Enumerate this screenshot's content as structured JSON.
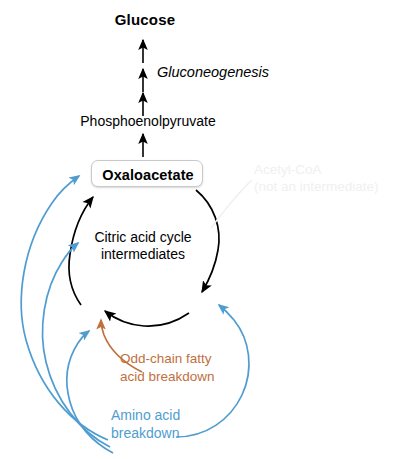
{
  "diagram": {
    "nodes": {
      "glucose": "Glucose",
      "pathway": "Gluconeogenesis",
      "pep": "Phosphoenolpyruvate",
      "oxaloacetate": "Oxaloacetate",
      "cycle_line1": "Citric acid cycle",
      "cycle_line2": "intermediates",
      "acetyl_line1": "Acetyl-CoA",
      "acetyl_line2": "(not an intermediate)",
      "odd_chain_line1": "Odd-chain fatty",
      "odd_chain_line2": "acid breakdown",
      "amino_line1": "Amino acid",
      "amino_line2": "breakdown"
    },
    "colors": {
      "black": "#000000",
      "blue": "#4f9dd0",
      "orange": "#c1703d",
      "faint_gray": "#f0f0f0",
      "box_border": "#c9c9c9",
      "background": "#ffffff"
    }
  }
}
